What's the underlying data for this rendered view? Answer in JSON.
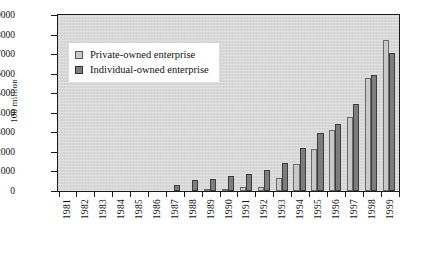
{
  "chart_data": {
    "type": "bar",
    "title": "",
    "subtitle": "",
    "xlabel": "",
    "ylabel": "100 million",
    "ylim": [
      0,
      9000
    ],
    "ytick_step": 1000,
    "yticks": [
      "9000",
      "8000",
      "7000",
      "6000",
      "5000",
      "4000",
      "3000",
      "2000",
      "1000",
      "0"
    ],
    "grid": false,
    "legend_position": "upper-left-inside",
    "categories": [
      "1981",
      "1982",
      "1983",
      "1984",
      "1985",
      "1986",
      "1987",
      "1988",
      "1989",
      "1990",
      "1991",
      "1992",
      "1993",
      "1994",
      "1995",
      "1996",
      "1997",
      "1998",
      "1999"
    ],
    "series": [
      {
        "name": "Private-owned enterprise",
        "color": "#c9c9c9",
        "values": [
          0,
          0,
          0,
          0,
          0,
          0,
          0,
          0,
          100,
          120,
          180,
          230,
          680,
          1400,
          2150,
          3100,
          3800,
          5800,
          7700
        ]
      },
      {
        "name": "Individual-owned enterprise",
        "color": "#7d7d7d",
        "values": [
          0,
          0,
          0,
          0,
          0,
          0,
          300,
          580,
          640,
          780,
          870,
          1100,
          1450,
          2200,
          2950,
          3450,
          4450,
          5950,
          7050
        ]
      }
    ]
  },
  "legend": {
    "items": [
      {
        "label": "Private-owned enterprise",
        "swatch": "private"
      },
      {
        "label": "Individual-owned enterprise",
        "swatch": "individual"
      }
    ]
  },
  "axes": {
    "y_title": "100 million"
  }
}
